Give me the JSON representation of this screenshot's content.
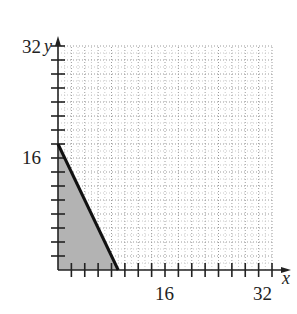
{
  "chart_data": {
    "type": "area",
    "title": "",
    "xlabel": "x",
    "ylabel": "y",
    "xlim": [
      0,
      32
    ],
    "ylim": [
      0,
      32
    ],
    "x_ticks_major": [
      16,
      32
    ],
    "y_ticks_major": [
      16,
      32
    ],
    "tick_step": 2,
    "grid": true,
    "grid_style": "dotted",
    "series": [
      {
        "name": "boundary line",
        "kind": "line",
        "points": [
          [
            0,
            18
          ],
          [
            9,
            0
          ]
        ],
        "color": "#111111"
      },
      {
        "name": "shaded region",
        "kind": "polygon",
        "points": [
          [
            0,
            0
          ],
          [
            0,
            18
          ],
          [
            9,
            0
          ]
        ],
        "color": "#b3b3b3"
      }
    ]
  },
  "labels": {
    "x_axis": "x",
    "y_axis": "y",
    "x_tick_16": "16",
    "x_tick_32": "32",
    "y_tick_16": "16",
    "y_tick_32": "32"
  }
}
